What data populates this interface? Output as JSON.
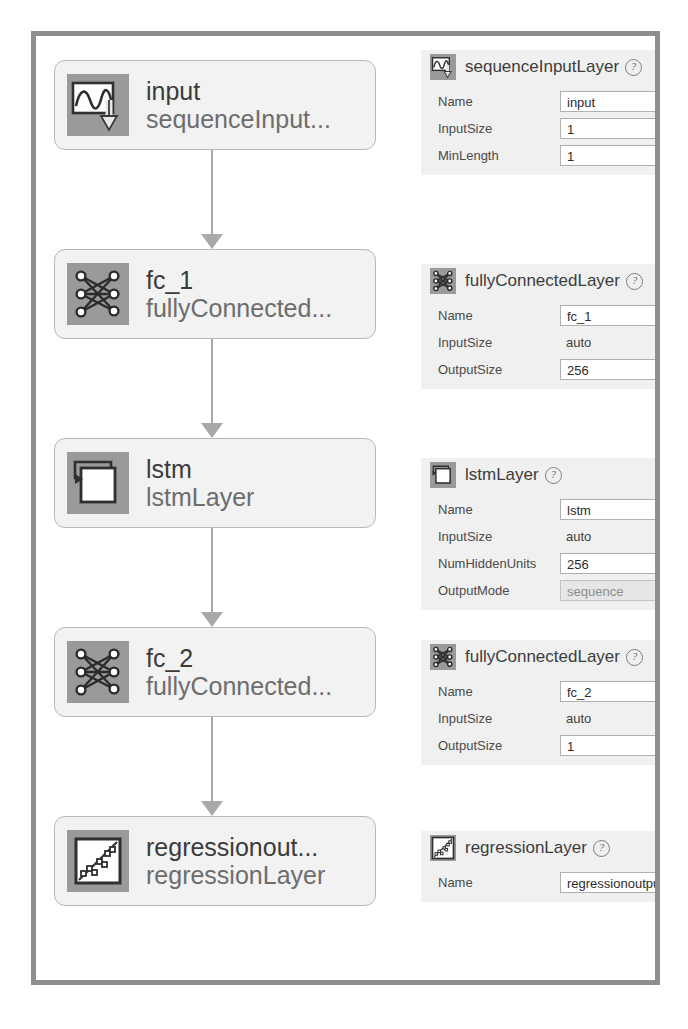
{
  "app": {
    "title": "Deep Network Designer - Network Graph and Layer Properties"
  },
  "colors": {
    "frame_border": "#8e8e8e",
    "node_fill": "#f2f2f2",
    "node_border": "#b9b9b9",
    "icon_bg": "#9a9a9a",
    "connector": "#a9a9a9",
    "panel_bg": "#f0f0f0",
    "field_bg": "#ffffff",
    "dropdown_bg": "#e6e6e6"
  },
  "graph": {
    "nodes": [
      {
        "name": "input",
        "type": "sequenceInput...",
        "icon": "sequence-input-icon"
      },
      {
        "name": "fc_1",
        "type": "fullyConnected...",
        "icon": "fully-connected-icon"
      },
      {
        "name": "lstm",
        "type": "lstmLayer",
        "icon": "lstm-icon"
      },
      {
        "name": "fc_2",
        "type": "fullyConnected...",
        "icon": "fully-connected-icon"
      },
      {
        "name": "regressionout...",
        "type": "regressionLayer",
        "icon": "regression-icon"
      }
    ]
  },
  "panels": [
    {
      "title": "sequenceInputLayer",
      "icon": "sequence-input-icon",
      "help": "?",
      "properties": [
        {
          "label": "Name",
          "value": "input",
          "kind": "field"
        },
        {
          "label": "InputSize",
          "value": "1",
          "kind": "field"
        },
        {
          "label": "MinLength",
          "value": "1",
          "kind": "field"
        }
      ]
    },
    {
      "title": "fullyConnectedLayer",
      "icon": "fully-connected-icon",
      "help": "?",
      "properties": [
        {
          "label": "Name",
          "value": "fc_1",
          "kind": "field"
        },
        {
          "label": "InputSize",
          "value": "auto",
          "kind": "static"
        },
        {
          "label": "OutputSize",
          "value": "256",
          "kind": "field"
        }
      ]
    },
    {
      "title": "lstmLayer",
      "icon": "lstm-icon",
      "help": "?",
      "properties": [
        {
          "label": "Name",
          "value": "lstm",
          "kind": "field"
        },
        {
          "label": "InputSize",
          "value": "auto",
          "kind": "static"
        },
        {
          "label": "NumHiddenUnits",
          "value": "256",
          "kind": "field"
        },
        {
          "label": "OutputMode",
          "value": "sequence",
          "kind": "dropdown"
        }
      ]
    },
    {
      "title": "fullyConnectedLayer",
      "icon": "fully-connected-icon",
      "help": "?",
      "properties": [
        {
          "label": "Name",
          "value": "fc_2",
          "kind": "field"
        },
        {
          "label": "InputSize",
          "value": "auto",
          "kind": "static"
        },
        {
          "label": "OutputSize",
          "value": "1",
          "kind": "field"
        }
      ]
    },
    {
      "title": "regressionLayer",
      "icon": "regression-icon",
      "help": "?",
      "properties": [
        {
          "label": "Name",
          "value": "regressionoutput",
          "kind": "field"
        }
      ]
    }
  ]
}
